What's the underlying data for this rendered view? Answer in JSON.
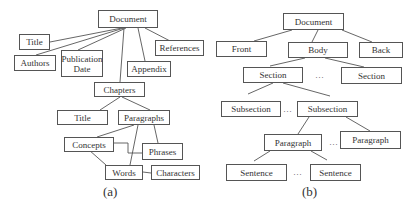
{
  "diagram_a": {
    "caption": "(a)",
    "nodes": {
      "document": "Document",
      "title": "Title",
      "authors": "Authors",
      "publication_date": "Publication\nDate",
      "appendix": "Appendix",
      "references": "References",
      "chapters": "Chapters",
      "chapter_title": "Title",
      "paragraphs": "Paragraphs",
      "concepts": "Concepts",
      "phrases": "Phrases",
      "words": "Words",
      "characters": "Characters"
    }
  },
  "diagram_b": {
    "caption": "(b)",
    "ellipsis": "…",
    "nodes": {
      "document": "Document",
      "front": "Front",
      "body": "Body",
      "back": "Back",
      "section_1": "Section",
      "section_2": "Section",
      "subsection_1": "Subsection",
      "subsection_2": "Subsection",
      "paragraph_1": "Paragraph",
      "paragraph_2": "Paragraph",
      "sentence_1": "Sentence",
      "sentence_2": "Sentence"
    }
  }
}
